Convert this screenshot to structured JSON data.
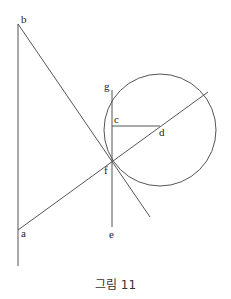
{
  "figure": {
    "caption": "그림 11",
    "labels": {
      "a": "a",
      "b": "b",
      "c": "c",
      "d": "d",
      "e": "e",
      "f": "f",
      "g": "g"
    },
    "points": {
      "a": [
        18,
        230
      ],
      "b": [
        18,
        24
      ],
      "c": [
        112,
        126
      ],
      "d": [
        160,
        126
      ],
      "e": [
        112,
        227
      ],
      "f": [
        112,
        162
      ],
      "g": [
        112,
        90
      ]
    },
    "circle": {
      "center": [
        160,
        130
      ],
      "radius": 56
    },
    "colors": {
      "stroke": "#555555",
      "text": "#222222"
    }
  }
}
